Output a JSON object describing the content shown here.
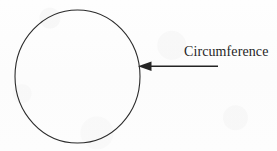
{
  "figure": {
    "type": "geometry-diagram",
    "background_color": "#fdfdfd",
    "ink_color": "#262626"
  },
  "shapes": {
    "circle": {
      "name": "circle-outline",
      "center_x": 77.5,
      "center_y": 76.5,
      "radius_x": 62.5,
      "radius_y": 66.5,
      "stroke_color": "#2b2b2b",
      "stroke_width": 1.1,
      "fill": "none"
    },
    "arrow": {
      "name": "circumference-pointer",
      "direction": "left",
      "tip_x": 138,
      "tip_y": 66,
      "tail_x": 218,
      "tail_y": 66,
      "head_length": 13,
      "head_half_height": 4.5,
      "stroke_color": "#242424",
      "stroke_width": 1.4
    }
  },
  "labels": {
    "circumference": "Circumference"
  }
}
